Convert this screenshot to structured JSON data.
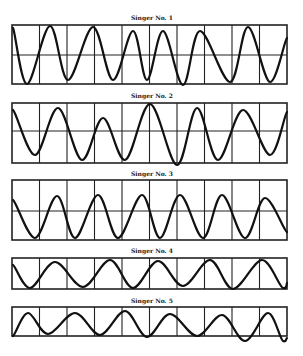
{
  "chart_data": [
    {
      "type": "line",
      "title": "Singer No. 1",
      "panel": {
        "x0": 12,
        "x1": 287,
        "y0": 25,
        "y1": 84,
        "mid": 55,
        "show_mid": true,
        "columns": 10
      },
      "points": [
        [
          13,
          28
        ],
        [
          27,
          84
        ],
        [
          50,
          26
        ],
        [
          68,
          80
        ],
        [
          93,
          27
        ],
        [
          113,
          80
        ],
        [
          133,
          31
        ],
        [
          147,
          80
        ],
        [
          163,
          31
        ],
        [
          183,
          85
        ],
        [
          200,
          31
        ],
        [
          230,
          82
        ],
        [
          248,
          27
        ],
        [
          270,
          82
        ],
        [
          287,
          38
        ]
      ],
      "xlabel": "",
      "ylabel": "",
      "grid": true
    },
    {
      "type": "line",
      "title": "Singer No. 2",
      "panel": {
        "x0": 12,
        "x1": 287,
        "y0": 103,
        "y1": 163,
        "mid": 131,
        "show_mid": true,
        "columns": 10
      },
      "points": [
        [
          13,
          110
        ],
        [
          35,
          155
        ],
        [
          58,
          108
        ],
        [
          82,
          160
        ],
        [
          103,
          118
        ],
        [
          125,
          160
        ],
        [
          150,
          104
        ],
        [
          177,
          165
        ],
        [
          197,
          108
        ],
        [
          218,
          160
        ],
        [
          243,
          110
        ],
        [
          270,
          155
        ],
        [
          287,
          112
        ]
      ],
      "xlabel": "",
      "ylabel": "",
      "grid": true
    },
    {
      "type": "line",
      "title": "Singer No. 3",
      "panel": {
        "x0": 12,
        "x1": 287,
        "y0": 180,
        "y1": 240,
        "mid": 211,
        "show_mid": true,
        "columns": 10
      },
      "points": [
        [
          13,
          200
        ],
        [
          35,
          238
        ],
        [
          57,
          196
        ],
        [
          75,
          238
        ],
        [
          98,
          195
        ],
        [
          118,
          238
        ],
        [
          142,
          195
        ],
        [
          160,
          238
        ],
        [
          180,
          195
        ],
        [
          203,
          238
        ],
        [
          222,
          195
        ],
        [
          245,
          238
        ],
        [
          265,
          198
        ],
        [
          287,
          232
        ]
      ],
      "xlabel": "",
      "ylabel": "",
      "grid": true
    },
    {
      "type": "line",
      "title": "Singer No. 4",
      "panel": {
        "x0": 12,
        "x1": 287,
        "y0": 258,
        "y1": 289,
        "mid": null,
        "show_mid": false,
        "columns": 10
      },
      "points": [
        [
          13,
          265
        ],
        [
          30,
          288
        ],
        [
          55,
          262
        ],
        [
          83,
          287
        ],
        [
          110,
          260
        ],
        [
          133,
          288
        ],
        [
          158,
          261
        ],
        [
          183,
          286
        ],
        [
          210,
          260
        ],
        [
          233,
          289
        ],
        [
          262,
          260
        ],
        [
          283,
          288
        ],
        [
          287,
          283
        ]
      ],
      "xlabel": "",
      "ylabel": "",
      "grid": true
    },
    {
      "type": "line",
      "title": "Singer No. 5",
      "panel": {
        "x0": 12,
        "x1": 287,
        "y0": 307,
        "y1": 336,
        "mid": null,
        "show_mid": false,
        "columns": 10
      },
      "points": [
        [
          13,
          336
        ],
        [
          28,
          313
        ],
        [
          48,
          334
        ],
        [
          75,
          313
        ],
        [
          100,
          335
        ],
        [
          125,
          311
        ],
        [
          147,
          337
        ],
        [
          170,
          314
        ],
        [
          197,
          336
        ],
        [
          222,
          315
        ],
        [
          245,
          341
        ],
        [
          268,
          313
        ],
        [
          283,
          341
        ],
        [
          287,
          338
        ]
      ],
      "xlabel": "",
      "ylabel": "",
      "grid": true
    }
  ],
  "titles": [
    "Singer No. 1",
    "Singer No. 2",
    "Singer No. 3",
    "Singer No. 4",
    "Singer No. 5"
  ],
  "colors": {
    "ink": "#111111",
    "paper": "#ffffff"
  }
}
